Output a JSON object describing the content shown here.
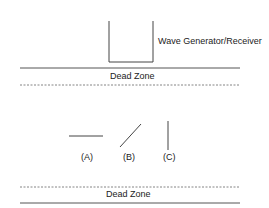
{
  "diagram": {
    "device_label": "Wave Generator/Receiver",
    "top_zone_label": "Dead Zone",
    "bottom_zone_label": "Dead Zone",
    "orientations": [
      {
        "label": "(A)",
        "type": "horizontal"
      },
      {
        "label": "(B)",
        "type": "diagonal"
      },
      {
        "label": "(C)",
        "type": "vertical"
      }
    ],
    "colors": {
      "line": "#444444",
      "text": "#222222",
      "background": "#ffffff"
    }
  }
}
